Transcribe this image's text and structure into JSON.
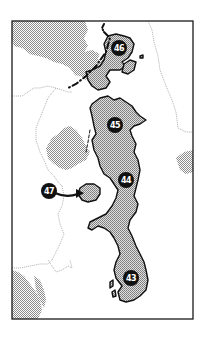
{
  "map": {
    "frame": {
      "x": 12,
      "y": 21,
      "width": 181,
      "height": 298
    },
    "colors": {
      "background": "#ffffff",
      "frame": "#1a1a1a",
      "highlight_fill": "#b4b4b4",
      "highlight_outline": "#111111",
      "terrain_fill": "#c6c6c6",
      "boundary_line": "#9a9a9a",
      "marker_fill": "#111111",
      "marker_text": "#ffffff"
    },
    "markers": [
      {
        "id": "46",
        "label": "46",
        "x": 119,
        "y": 48
      },
      {
        "id": "45",
        "label": "45",
        "x": 115,
        "y": 125
      },
      {
        "id": "44",
        "label": "44",
        "x": 126,
        "y": 180
      },
      {
        "id": "47",
        "label": "47",
        "x": 49,
        "y": 191
      },
      {
        "id": "43",
        "label": "43",
        "x": 131,
        "y": 278
      }
    ],
    "arrow": {
      "from": "47",
      "to_region": "island-west-of-44"
    }
  }
}
